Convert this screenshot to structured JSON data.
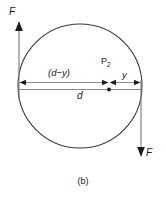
{
  "figure": {
    "caption": "(b)",
    "type": "free-body-diagram",
    "background_color": "#ffffff",
    "ink_color": "#1a1a1a",
    "dimension_line_color": "#808080",
    "circle": {
      "center_x": 80,
      "center_y": 86,
      "radius": 62,
      "stroke_color": "#3a3a3a",
      "stroke_width": 1
    },
    "labels": {
      "force_top": "F",
      "force_bottom": "F",
      "segment_left": "(d−y)",
      "segment_right": "y",
      "diameter": "d",
      "point": "P",
      "point_subscript": "2"
    },
    "arrows": {
      "top_force_direction": "up",
      "bottom_force_direction": "down",
      "dimension_arrow_style": "double-headed"
    },
    "point_marker": {
      "label": "P2",
      "x": 109,
      "y": 87
    }
  }
}
